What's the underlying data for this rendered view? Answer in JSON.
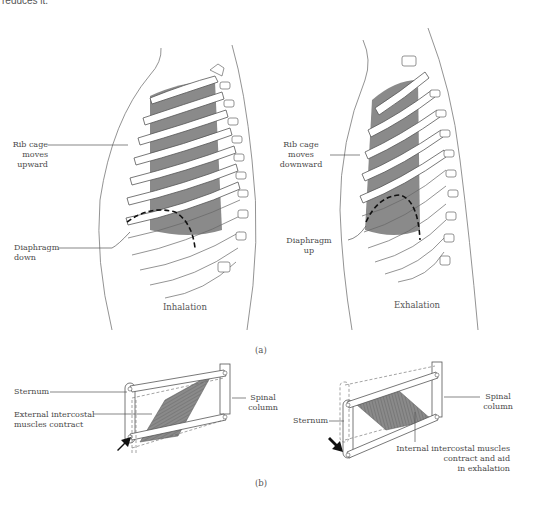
{
  "header": {
    "partial_text": "reduces it."
  },
  "part_a": {
    "caption": "(a)",
    "inhalation": {
      "title": "Inhalation",
      "rib_label": "Rib cage\nmoves\nupward",
      "diaphragm_label": "Diaphragm\ndown"
    },
    "exhalation": {
      "title": "Exhalation",
      "rib_label": "Rib cage\nmoves\ndownward",
      "diaphragm_label": "Diaphragm\nup"
    }
  },
  "part_b": {
    "caption": "(b)",
    "left": {
      "sternum_label": "Sternum",
      "spinal_label": "Spinal\ncolumn",
      "muscle_label": "External intercostal\nmuscles contract"
    },
    "right": {
      "sternum_label": "Sternum",
      "spinal_label": "Spinal\ncolumn",
      "muscle_label": "Internal intercostal muscles\ncontract and aid\nin exhalation"
    }
  },
  "colors": {
    "muscle_fill": "#8a8a8a",
    "line": "#555555",
    "bone": "#ffffff"
  }
}
